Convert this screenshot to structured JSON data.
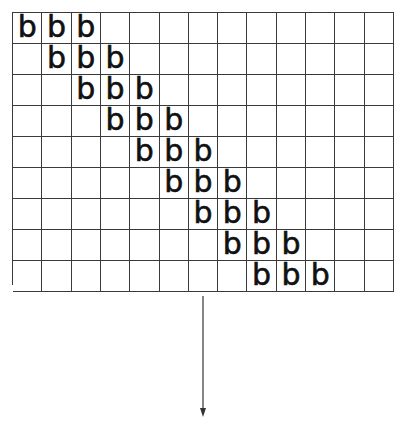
{
  "diagram": {
    "grid": {
      "rows": 9,
      "cols": 13,
      "line_color": "#3a3a3a",
      "fill_letter": "b",
      "filled_cells": [
        [
          0,
          0
        ],
        [
          0,
          1
        ],
        [
          0,
          2
        ],
        [
          1,
          1
        ],
        [
          1,
          2
        ],
        [
          1,
          3
        ],
        [
          2,
          2
        ],
        [
          2,
          3
        ],
        [
          2,
          4
        ],
        [
          3,
          3
        ],
        [
          3,
          4
        ],
        [
          3,
          5
        ],
        [
          4,
          4
        ],
        [
          4,
          5
        ],
        [
          4,
          6
        ],
        [
          5,
          5
        ],
        [
          5,
          6
        ],
        [
          5,
          7
        ],
        [
          6,
          6
        ],
        [
          6,
          7
        ],
        [
          6,
          8
        ],
        [
          7,
          7
        ],
        [
          7,
          8
        ],
        [
          7,
          9
        ],
        [
          8,
          8
        ],
        [
          8,
          9
        ],
        [
          8,
          10
        ]
      ]
    },
    "arrow": {
      "direction": "down",
      "color": "#444444"
    }
  }
}
